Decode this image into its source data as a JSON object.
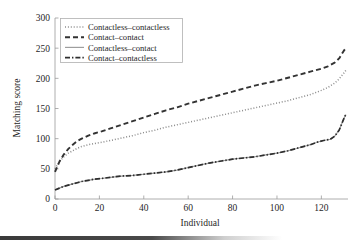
{
  "chart_data": {
    "type": "line",
    "title": "",
    "xlabel": "Individual",
    "ylabel": "Matching score",
    "xlim": [
      0,
      132
    ],
    "ylim": [
      0,
      300
    ],
    "xticks": [
      0,
      20,
      40,
      60,
      80,
      100,
      120
    ],
    "yticks": [
      0,
      50,
      100,
      150,
      200,
      250,
      300
    ],
    "grid": false,
    "legend_position": "upper left",
    "series": [
      {
        "name": "Contactless–contactless",
        "style": "dotted",
        "color": "#8c8c8c",
        "x": [
          0,
          2,
          4,
          6,
          8,
          10,
          12,
          15,
          18,
          21,
          25,
          30,
          35,
          40,
          45,
          50,
          55,
          60,
          65,
          70,
          75,
          80,
          85,
          90,
          95,
          100,
          105,
          110,
          115,
          120,
          123,
          126,
          128,
          130,
          131
        ],
        "values": [
          50,
          62,
          70,
          76,
          80,
          84,
          87,
          90,
          92,
          94,
          97,
          101,
          105,
          110,
          114,
          119,
          123,
          127,
          131,
          135,
          139,
          143,
          147,
          151,
          155,
          159,
          163,
          168,
          173,
          180,
          185,
          192,
          199,
          208,
          213
        ]
      },
      {
        "name": "Contact–contact",
        "style": "dashed",
        "color": "#333333",
        "x": [
          0,
          2,
          4,
          6,
          8,
          10,
          12,
          15,
          18,
          21,
          25,
          30,
          35,
          40,
          45,
          50,
          55,
          60,
          65,
          70,
          75,
          80,
          85,
          90,
          95,
          100,
          105,
          110,
          115,
          120,
          123,
          126,
          128,
          130,
          131
        ],
        "values": [
          45,
          62,
          74,
          83,
          90,
          96,
          100,
          105,
          109,
          112,
          117,
          123,
          129,
          135,
          141,
          147,
          152,
          158,
          163,
          168,
          173,
          178,
          183,
          188,
          192,
          196,
          201,
          206,
          211,
          216,
          220,
          226,
          233,
          245,
          250
        ]
      },
      {
        "name": "Contactless–contact",
        "style": "solid",
        "color": "#9e9e9e",
        "x": [
          0,
          2,
          4,
          6,
          8,
          10,
          12,
          15,
          18,
          21,
          25,
          30,
          35,
          40,
          45,
          50,
          55,
          60,
          65,
          70,
          75,
          80,
          85,
          90,
          95,
          100,
          105,
          110,
          115,
          118,
          121,
          124,
          126,
          128,
          130,
          131
        ],
        "values": [
          15,
          18,
          21,
          23,
          25,
          27,
          29,
          31,
          33,
          34,
          36,
          38,
          39,
          41,
          43,
          45,
          48,
          52,
          56,
          60,
          63,
          66,
          68,
          70,
          73,
          76,
          80,
          85,
          90,
          94,
          97,
          99,
          104,
          114,
          132,
          140
        ]
      },
      {
        "name": "Contact–contactless",
        "style": "dashdot",
        "color": "#2e2e2e",
        "x": [
          0,
          2,
          4,
          6,
          8,
          10,
          12,
          15,
          18,
          21,
          25,
          30,
          35,
          40,
          45,
          50,
          55,
          60,
          65,
          70,
          75,
          80,
          85,
          90,
          95,
          100,
          105,
          110,
          115,
          118,
          121,
          124,
          126,
          128,
          130,
          131
        ],
        "values": [
          15,
          18,
          21,
          23,
          25,
          27,
          29,
          31,
          33,
          34,
          36,
          38,
          39,
          41,
          43,
          45,
          48,
          52,
          56,
          60,
          63,
          66,
          68,
          70,
          73,
          76,
          80,
          85,
          90,
          94,
          97,
          99,
          104,
          114,
          132,
          140
        ]
      }
    ]
  },
  "axes": {
    "ylabel": "Matching score",
    "xlabel": "Individual",
    "yticks": [
      "0",
      "50",
      "100",
      "150",
      "200",
      "250",
      "300"
    ],
    "xticks": [
      "0",
      "20",
      "40",
      "60",
      "80",
      "100",
      "120"
    ]
  },
  "legend": {
    "items": [
      {
        "label": "Contactless–contactless",
        "style": "dotted"
      },
      {
        "label": "Contact–contact",
        "style": "dashed"
      },
      {
        "label": "Contactless–contact",
        "style": "solid"
      },
      {
        "label": "Contact–contactless",
        "style": "dashdot"
      }
    ]
  }
}
